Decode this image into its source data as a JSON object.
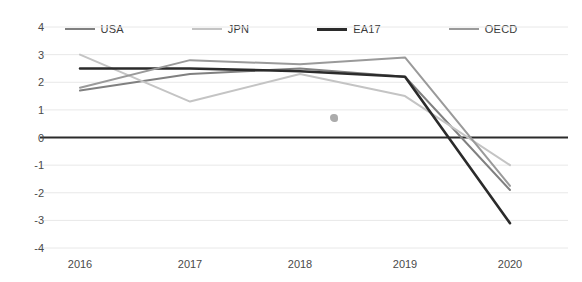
{
  "chart_data": {
    "type": "line",
    "title": "",
    "subtitle": "",
    "xlabel": "",
    "ylabel": "",
    "categories": [
      "2016",
      "2017",
      "2018",
      "2019",
      "2020"
    ],
    "x": [
      2016,
      2017,
      2018,
      2019,
      2020
    ],
    "xlim": [
      2016,
      2020
    ],
    "ylim": [
      -4,
      4
    ],
    "yticks": [
      "4",
      "3",
      "2",
      "1",
      "0",
      "-1",
      "-2",
      "-3",
      "-4"
    ],
    "ytick_values": [
      4,
      3,
      2,
      1,
      0,
      -1,
      -2,
      -3,
      -4
    ],
    "grid": true,
    "grid_axis": "y",
    "zero_line": true,
    "legend_position": "top",
    "series": [
      {
        "name": "USA",
        "color": "#808080",
        "width": 2,
        "values": [
          1.7,
          2.3,
          2.5,
          2.2,
          -1.9
        ]
      },
      {
        "name": "JPN",
        "color": "#c4c4c4",
        "width": 2,
        "values": [
          3.0,
          1.3,
          2.3,
          1.5,
          -1.0
        ]
      },
      {
        "name": "EA17",
        "color": "#2b2b2b",
        "width": 2.6,
        "values": [
          2.5,
          2.5,
          2.4,
          2.2,
          -3.1
        ]
      },
      {
        "name": "OECD",
        "color": "#9a9a9a",
        "width": 2,
        "values": [
          1.8,
          2.8,
          2.65,
          2.9,
          -1.75
        ]
      }
    ]
  },
  "legend": {
    "items": [
      {
        "label": "USA"
      },
      {
        "label": "JPN"
      },
      {
        "label": "EA17"
      },
      {
        "label": "OECD"
      }
    ]
  },
  "axes": {
    "y_labels": [
      "4",
      "3",
      "2",
      "1",
      "0",
      "-1",
      "-2",
      "-3",
      "-4"
    ],
    "x_labels": [
      "2016",
      "2017",
      "2018",
      "2019",
      "2020"
    ]
  },
  "colors": {
    "usa": "#808080",
    "jpn": "#c4c4c4",
    "ea17": "#2b2b2b",
    "oecd": "#9a9a9a",
    "grid": "#e8e8e8",
    "zero": "#2b2b2b",
    "text": "#4a4a4a",
    "background": "#ffffff"
  }
}
